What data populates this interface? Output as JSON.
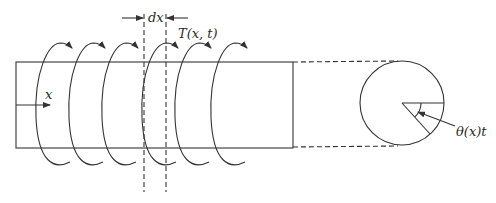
{
  "diagram": {
    "labels": {
      "increment": "dx",
      "torque": "T(x, t)",
      "axis": "x",
      "twist_angle": "θ(x)t"
    },
    "torque_arrow_count": 6,
    "colors": {
      "stroke": "#333333",
      "background": "#ffffff"
    }
  }
}
